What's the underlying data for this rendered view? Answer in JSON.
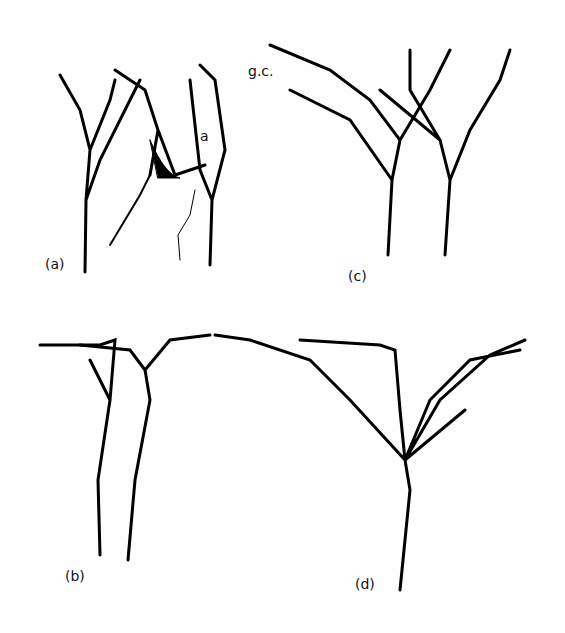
{
  "panels": [
    {
      "label": "(a)"
    },
    {
      "label": "(b)"
    },
    {
      "label": "(c)"
    },
    {
      "label": "(d)"
    }
  ],
  "annotations": {
    "a": "a",
    "gc": "g.c."
  }
}
